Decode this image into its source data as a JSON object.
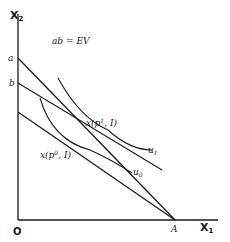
{
  "diagram": {
    "axes": {
      "y_label": "X",
      "y_label_sub": "2",
      "x_label": "X",
      "x_label_sub": "1",
      "origin_label": "O"
    },
    "annotation": "ab = EV",
    "intercepts": {
      "a": "a",
      "b": "b",
      "A": "A"
    },
    "points": {
      "p1_label": "x(p",
      "p1_sup": "1",
      "p1_tail": ", I)",
      "p0_label": "x(p",
      "p0_sup": "0",
      "p0_tail": ", I)"
    },
    "curves": {
      "u1": "u",
      "u1_sub": "1",
      "u0": "u",
      "u0_sub": "0"
    },
    "colors": {
      "ink": "#1a1a1a",
      "background": "#ffffff"
    }
  }
}
